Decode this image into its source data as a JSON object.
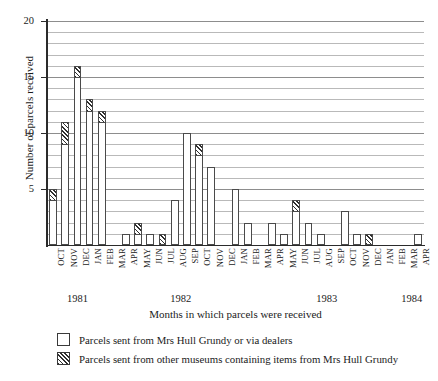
{
  "chart_data": {
    "type": "bar",
    "title": "",
    "subtitle": "",
    "xlabel": "Months in which parcels were received",
    "ylabel": "Number of parcels received",
    "ylim": [
      0,
      20
    ],
    "yticks": [
      5,
      10,
      15,
      20
    ],
    "ytick_labels": [
      "5",
      "10",
      "15",
      "20"
    ],
    "y_minor_step": 1,
    "grid": true,
    "grid_axis": "y",
    "stacked": true,
    "legend_position": "below",
    "legend": [
      {
        "key": "white",
        "label": "Parcels sent from Mrs Hull Grundy or via dealers",
        "swatch": "white"
      },
      {
        "key": "hatch",
        "label": "Parcels sent from other museums containing items from Mrs Hull Grundy",
        "swatch": "hatched"
      }
    ],
    "categories": [
      "OCT",
      "NOV",
      "DEC",
      "JAN",
      "FEB",
      "MAR",
      "APR",
      "MAY",
      "JUN",
      "JUL",
      "AUG",
      "SEP",
      "OCT",
      "NOV",
      "DEC",
      "JAN",
      "FEB",
      "MAR",
      "APR",
      "MAY",
      "JUN",
      "JUL",
      "AUG",
      "SEP",
      "OCT",
      "NOV",
      "DEC",
      "JAN",
      "FEB",
      "MAR",
      "APR"
    ],
    "year_groups": [
      {
        "label": "1981",
        "start_index": 0,
        "end_index": 4
      },
      {
        "label": "1982",
        "start_index": 5,
        "end_index": 16
      },
      {
        "label": "1983",
        "start_index": 17,
        "end_index": 28
      },
      {
        "label": "1984",
        "start_index": 29,
        "end_index": 30
      }
    ],
    "series": [
      {
        "name": "Parcels sent from Mrs Hull Grundy or via dealers",
        "style": "white",
        "values": [
          4,
          9,
          15,
          12,
          11,
          0,
          1,
          1,
          1,
          0,
          4,
          10,
          8,
          7,
          0,
          5,
          2,
          0,
          2,
          1,
          3,
          2,
          1,
          0,
          3,
          1,
          0,
          0,
          0,
          0,
          1
        ]
      },
      {
        "name": "Parcels sent from other museums containing items from Mrs Hull Grundy",
        "style": "hatched",
        "values": [
          1,
          2,
          1,
          1,
          1,
          0,
          0,
          1,
          0,
          1,
          0,
          0,
          1,
          0,
          0,
          0,
          0,
          0,
          0,
          0,
          1,
          0,
          0,
          0,
          0,
          0,
          1,
          0,
          0,
          0,
          0
        ]
      }
    ],
    "totals": [
      5,
      11,
      16,
      13,
      12,
      0,
      1,
      2,
      1,
      1,
      4,
      10,
      9,
      7,
      0,
      5,
      2,
      0,
      2,
      1,
      4,
      2,
      1,
      0,
      3,
      1,
      1,
      0,
      0,
      0,
      1
    ]
  },
  "colors": {
    "axis": "#2b2b2b",
    "gridline": "#b9b9b9",
    "bar_outline": "#4a4a4a",
    "hatch": "#2f2f2f",
    "background": "#ffffff"
  }
}
